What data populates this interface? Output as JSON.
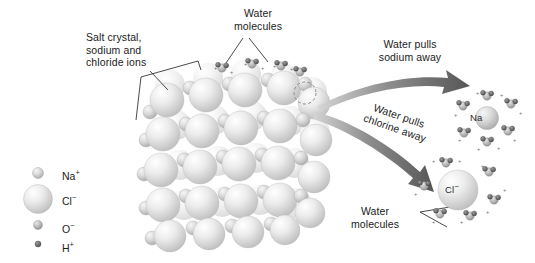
{
  "diagram": {
    "background_color": "#ffffff",
    "text_color": "#1b1b1b",
    "arrow_color": "#6e6e6e",
    "sphere_color": "#d8d8d8"
  },
  "legend": {
    "items": [
      {
        "name": "sodium-ion",
        "label": "Na",
        "charge": "+",
        "radius_px": 5.5,
        "fill": "#cfcfcf"
      },
      {
        "name": "chloride-ion",
        "label": "Cl",
        "charge": "−",
        "radius_px": 14.5,
        "fill": "#d9d9d9"
      },
      {
        "name": "oxygen-ion",
        "label": "O",
        "charge": "−",
        "radius_px": 4.5,
        "fill": "#c9c9c9"
      },
      {
        "name": "hydrogen-ion",
        "label": "H",
        "charge": "+",
        "radius_px": 3.0,
        "fill": "#8d8d8d"
      }
    ]
  },
  "annotations": {
    "salt_crystal": "Salt crystal,\nsodium and\nchloride ions",
    "water_molecules_top": "Water\nmolecules",
    "water_pulls_sodium": "Water pulls\nsodium away",
    "water_pulls_chlorine": "Water pulls\nchlorine away",
    "water_molecules_chloride": "Water\nmolecules"
  },
  "ions": {
    "hydrated_sodium_label": "Na",
    "hydrated_chloride_label": "Cl",
    "hydrated_chloride_charge": "−",
    "hydrated_sodium_water_count": 6,
    "hydrated_chloride_water_count": 6
  },
  "crystal": {
    "description": "Cubic lattice of alternating large chloride and small sodium spheres",
    "rows": 5,
    "columns": 5
  },
  "arrows": [
    {
      "name": "sodium-arrow",
      "label": "Water pulls sodium away"
    },
    {
      "name": "chlorine-arrow",
      "label": "Water pulls chlorine away"
    }
  ]
}
